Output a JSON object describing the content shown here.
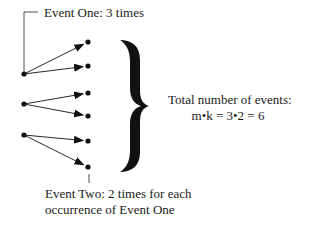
{
  "labels": {
    "event_one": "Event One: 3 times",
    "event_two_line1": "Event Two: 2 times for each",
    "event_two_line2": "occurrence of Event One",
    "total_line1": "Total number of events:",
    "total_line2": "m•k = 3•2 = 6"
  },
  "tree": {
    "roots": [
      {
        "x": 24,
        "y": 74,
        "children": [
          {
            "x": 88,
            "y": 42
          },
          {
            "x": 88,
            "y": 66
          }
        ]
      },
      {
        "x": 24,
        "y": 104,
        "children": [
          {
            "x": 88,
            "y": 93
          },
          {
            "x": 88,
            "y": 116
          }
        ]
      },
      {
        "x": 24,
        "y": 135,
        "children": [
          {
            "x": 88,
            "y": 141
          },
          {
            "x": 88,
            "y": 167
          }
        ]
      }
    ],
    "event_one_count": 3,
    "event_two_count_per_one": 2,
    "total": 6
  },
  "colors": {
    "ink": "#111111",
    "background": "#ffffff"
  }
}
